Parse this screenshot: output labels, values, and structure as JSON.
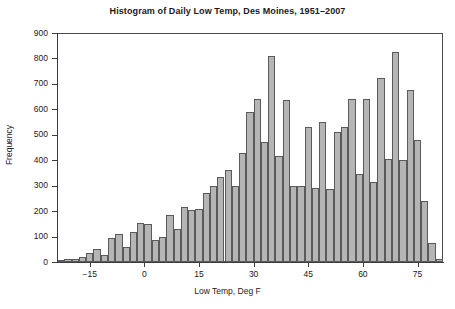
{
  "chart_data": {
    "type": "bar",
    "title": "Histogram of Daily Low Temp, Des Moines, 1951–2007",
    "xlabel": "Low Temp, Deg F",
    "ylabel": "Frequency",
    "xlim": [
      -24,
      82
    ],
    "ylim": [
      0,
      900
    ],
    "xticks": [
      -15,
      0,
      15,
      30,
      45,
      60,
      75
    ],
    "xtick_labels": [
      "−15",
      "0",
      "15",
      "30",
      "45",
      "60",
      "75"
    ],
    "yticks": [
      0,
      100,
      200,
      300,
      400,
      500,
      600,
      700,
      800,
      900
    ],
    "ytick_labels": [
      "0",
      "100",
      "200",
      "300",
      "400",
      "500",
      "600",
      "700",
      "800",
      "900"
    ],
    "grid": false,
    "legend": false,
    "bin_width": 2,
    "bar_fill": "#b5b5b5",
    "bar_edge": "#5a5a5a",
    "categories": [
      -23,
      -21,
      -19,
      -17,
      -15,
      -13,
      -11,
      -9,
      -7,
      -5,
      -3,
      -1,
      1,
      3,
      5,
      7,
      9,
      11,
      13,
      15,
      17,
      19,
      21,
      23,
      25,
      27,
      29,
      31,
      33,
      35,
      37,
      39,
      41,
      43,
      45,
      47,
      49,
      51,
      53,
      55,
      57,
      59,
      61,
      63,
      65,
      67,
      69,
      71,
      73,
      75,
      77,
      79,
      81
    ],
    "values": [
      5,
      10,
      12,
      18,
      35,
      52,
      28,
      95,
      112,
      60,
      118,
      152,
      150,
      88,
      100,
      185,
      130,
      215,
      205,
      210,
      270,
      300,
      335,
      360,
      300,
      430,
      590,
      640,
      470,
      810,
      415,
      635,
      300,
      300,
      530,
      290,
      550,
      285,
      510,
      530,
      640,
      345,
      640,
      315,
      725,
      405,
      825,
      400,
      675,
      480,
      240,
      75,
      10
    ]
  }
}
